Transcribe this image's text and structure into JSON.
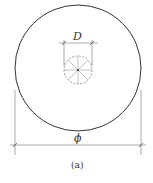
{
  "diagram": {
    "labels": {
      "small_diameter": "D",
      "large_diameter": "ϕ",
      "caption": "(a)"
    },
    "colors": {
      "stroke": "#333333",
      "dim_line": "#555555",
      "background": "#ffffff"
    },
    "large_circle": {
      "cx": 78,
      "cy": 68,
      "r": 63
    },
    "small_circle": {
      "cx": 78,
      "cy": 70,
      "r": 14,
      "style": "dashed",
      "spokes": 8
    }
  }
}
